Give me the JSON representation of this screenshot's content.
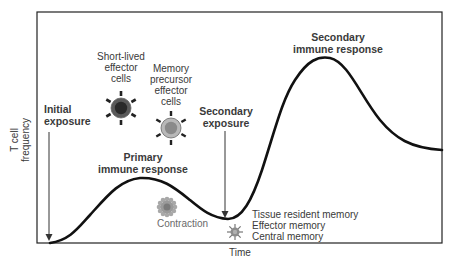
{
  "diagram": {
    "y_axis_label_line1": "T cell",
    "y_axis_label_line2": "frequency",
    "x_axis_label": "Time",
    "labels": {
      "initial_exposure_1": "Initial",
      "initial_exposure_2": "exposure",
      "short_lived_1": "Short-lived",
      "short_lived_2": "effector",
      "short_lived_3": "cells",
      "memory_precursor_1": "Memory",
      "memory_precursor_2": "precursor",
      "memory_precursor_3": "effector",
      "memory_precursor_4": "cells",
      "secondary_exposure_1": "Secondary",
      "secondary_exposure_2": "exposure",
      "primary_response_1": "Primary",
      "primary_response_2": "immune response",
      "secondary_response_1": "Secondary",
      "secondary_response_2": "immune response",
      "contraction": "Contraction",
      "memory_1": "Tissue resident memory",
      "memory_2": "Effector memory",
      "memory_3": "Central memory"
    },
    "colors": {
      "curve": "#111111",
      "short_lived_outer": "#5a5a5a",
      "short_lived_inner": "#2a2a2a",
      "memory_precursor_outer": "#b8b8b8",
      "memory_precursor_inner": "#8a8a8a",
      "contraction_cell": "#9a9a9a",
      "memory_cell": "#8c8c8c"
    }
  }
}
